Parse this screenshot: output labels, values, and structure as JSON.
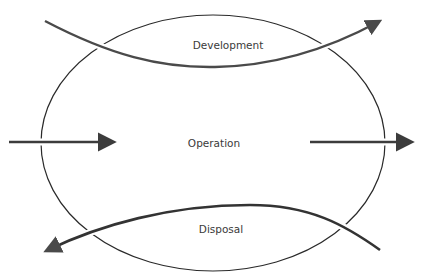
{
  "diagram": {
    "type": "lifecycle-ellipse",
    "stages": [
      {
        "id": "development",
        "label": "Development"
      },
      {
        "id": "operation",
        "label": "Operation"
      },
      {
        "id": "disposal",
        "label": "Disposal"
      }
    ],
    "flows": [
      {
        "id": "development-flow",
        "direction": "left-to-right, curving through top of ellipse",
        "arrowhead": "upper-right"
      },
      {
        "id": "input-flow",
        "direction": "left-to-right into ellipse",
        "arrowhead": "right"
      },
      {
        "id": "output-flow",
        "direction": "left-to-right out of ellipse",
        "arrowhead": "right"
      },
      {
        "id": "disposal-flow",
        "direction": "right-to-left, curving through bottom of ellipse",
        "arrowhead": "lower-left"
      }
    ]
  },
  "colors": {
    "ellipse_stroke": "#2a2a2a",
    "arrow_stroke": "#3c3c3c",
    "curve_stroke": "#4a4a4a",
    "text": "#3a3a3a",
    "background": "#ffffff"
  }
}
